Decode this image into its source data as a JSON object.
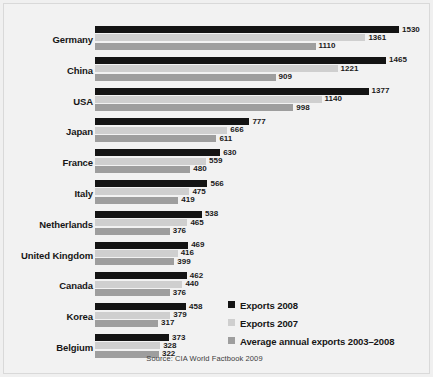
{
  "chart_data": {
    "type": "bar",
    "orientation": "horizontal",
    "title": "",
    "xlabel": "",
    "ylabel": "",
    "xlim": [
      0,
      1530
    ],
    "grid": false,
    "legend_position": "bottom-right",
    "source": "Source: CIA World Factbook 2009",
    "categories": [
      "Germany",
      "China",
      "USA",
      "Japan",
      "France",
      "Italy",
      "Netherlands",
      "United Kingdom",
      "Canada",
      "Korea",
      "Belgium"
    ],
    "series": [
      {
        "name": "Exports 2008",
        "color": "#141414",
        "values": [
          1530,
          1465,
          1377,
          777,
          630,
          566,
          538,
          469,
          462,
          458,
          373
        ]
      },
      {
        "name": "Exports 2007",
        "color": "#cfcfcf",
        "values": [
          1361,
          1221,
          1140,
          666,
          559,
          475,
          465,
          416,
          440,
          379,
          328
        ]
      },
      {
        "name": "Average annual exports 2003–2008",
        "color": "#9e9e9e",
        "values": [
          1110,
          909,
          998,
          611,
          480,
          419,
          376,
          399,
          376,
          317,
          322
        ]
      }
    ]
  },
  "legend": {
    "items": [
      {
        "label": "Exports 2008"
      },
      {
        "label": "Exports 2007"
      },
      {
        "label": "Average annual exports 2003–2008"
      }
    ]
  },
  "footer": {
    "source": "Source: CIA World Factbook 2009"
  }
}
